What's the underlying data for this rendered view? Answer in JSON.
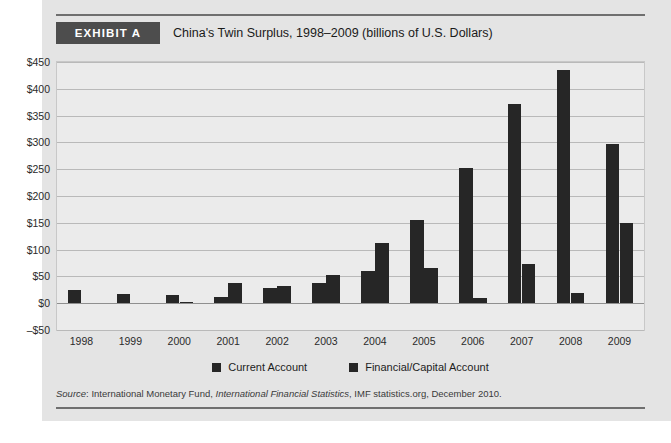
{
  "exhibit": {
    "badge_label": "EXHIBIT A",
    "title": "China's Twin Surplus, 1998–2009 (billions of U.S. Dollars)"
  },
  "source": {
    "prefix": "Source",
    "colon": ":",
    "publisher": " International Monetary Fund, ",
    "publication": "International Financial Statistics",
    "suffix": ", IMF statistics.org, December 2010."
  },
  "colors": {
    "bar": "#262626",
    "badge_bg": "#4d4d4d",
    "plot_bg": "#ebebeb",
    "page_bg": "#e4e4e4",
    "gridline": "#b9b9b9"
  },
  "chart_data": {
    "type": "bar",
    "title": "China's Twin Surplus, 1998–2009 (billions of U.S. Dollars)",
    "xlabel": "",
    "ylabel": "",
    "ylim": [
      -50,
      450
    ],
    "ytick_step": 50,
    "grid": true,
    "legend_position": "bottom",
    "ytick_labels": [
      "$450",
      "$400",
      "$350",
      "$300",
      "$250",
      "$200",
      "$150",
      "$100",
      "$50",
      "$0",
      "–$50"
    ],
    "ytick_values": [
      450,
      400,
      350,
      300,
      250,
      200,
      150,
      100,
      50,
      0,
      -50
    ],
    "categories": [
      "1998",
      "1999",
      "2000",
      "2001",
      "2002",
      "2003",
      "2004",
      "2005",
      "2006",
      "2007",
      "2008",
      "2009"
    ],
    "series": [
      {
        "name": "Current Account",
        "values": [
          25,
          17,
          15,
          12,
          28,
          38,
          60,
          155,
          253,
          372,
          436,
          297
        ]
      },
      {
        "name": "Financial/Capital Account",
        "values": [
          0,
          0,
          2,
          38,
          33,
          53,
          113,
          65,
          10,
          73,
          19,
          150
        ]
      }
    ]
  }
}
